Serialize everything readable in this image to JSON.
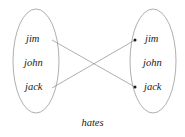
{
  "diagram": {
    "title": "hates",
    "relation_label": "hates",
    "stroke_color": "#8c8c8c",
    "text_color": "#1a1a1a",
    "background_color": "#ffffff",
    "left_set": {
      "name": "domain-set",
      "items": [
        {
          "label": "jim",
          "x": 26,
          "y": 40
        },
        {
          "label": "john",
          "x": 24,
          "y": 64
        },
        {
          "label": "jack",
          "x": 25,
          "y": 88
        }
      ],
      "ellipse": {
        "cx": 36,
        "cy": 61,
        "rx": 23,
        "ry": 52
      }
    },
    "right_set": {
      "name": "range-set",
      "items": [
        {
          "label": "jim",
          "x": 145,
          "y": 40
        },
        {
          "label": "john",
          "x": 143,
          "y": 64
        },
        {
          "label": "jack",
          "x": 144,
          "y": 88
        }
      ],
      "ellipse": {
        "cx": 153,
        "cy": 61,
        "rx": 23,
        "ry": 52
      }
    },
    "edges": [
      {
        "from": "jim",
        "to": "jack",
        "x1": 52,
        "y1": 40,
        "x2": 135,
        "y2": 87
      },
      {
        "from": "jack",
        "to": "jim",
        "x1": 52,
        "y1": 88,
        "x2": 135,
        "y2": 40
      }
    ],
    "endpoints": [
      {
        "for": "jim",
        "x": 135,
        "y": 40
      },
      {
        "for": "jack",
        "x": 135,
        "y": 87
      }
    ]
  }
}
